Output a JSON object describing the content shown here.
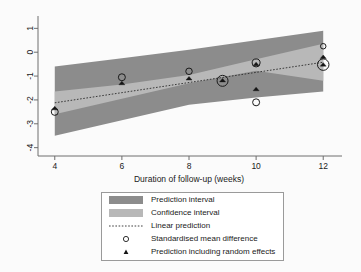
{
  "chart_data": {
    "type": "scatter",
    "title": "",
    "xlabel": "Duration of follow-up (weeks)",
    "ylabel": "",
    "xlim": [
      3.5,
      12.5
    ],
    "ylim": [
      -4.35,
      1.35
    ],
    "xticks": [
      4,
      6,
      8,
      10,
      12
    ],
    "yticks": [
      1,
      0,
      -1,
      -2,
      -3,
      -4
    ],
    "grid": false,
    "legend_position": "bottom-center",
    "series": [
      {
        "name": "Prediction interval",
        "type": "area",
        "color": "#8c8c8c",
        "x": [
          4,
          6,
          8,
          10,
          12
        ],
        "upper": [
          -0.6,
          -0.25,
          0.1,
          0.5,
          0.9
        ],
        "lower": [
          -3.5,
          -2.85,
          -2.2,
          -1.9,
          -1.65
        ]
      },
      {
        "name": "Confidence interval",
        "type": "area",
        "color": "#b8b8b8",
        "x": [
          4,
          6,
          8,
          10,
          12
        ],
        "upper": [
          -1.65,
          -1.35,
          -0.95,
          -0.3,
          0.35
        ],
        "lower": [
          -2.6,
          -1.95,
          -1.3,
          -0.78,
          -1.2
        ]
      },
      {
        "name": "Linear prediction",
        "type": "line",
        "style": "dotted",
        "color": "#2a2a2a",
        "x": [
          4,
          12
        ],
        "y": [
          -2.12,
          -0.42
        ]
      },
      {
        "name": "Standardised mean difference",
        "type": "bubble",
        "marker": "open-circle",
        "points": [
          {
            "x": 4,
            "y": -2.5,
            "size": 7.0
          },
          {
            "x": 6,
            "y": -1.05,
            "size": 7.0
          },
          {
            "x": 8,
            "y": -0.8,
            "size": 6.5
          },
          {
            "x": 9,
            "y": -1.2,
            "size": 11.0
          },
          {
            "x": 10,
            "y": -0.45,
            "size": 8.0
          },
          {
            "x": 10,
            "y": -2.1,
            "size": 7.0
          },
          {
            "x": 12,
            "y": 0.25,
            "size": 5.5
          },
          {
            "x": 12,
            "y": -0.52,
            "size": 11.5
          }
        ]
      },
      {
        "name": "Prediction including random effects",
        "type": "scatter",
        "marker": "filled-triangle",
        "points": [
          {
            "x": 4,
            "y": -2.35
          },
          {
            "x": 6,
            "y": -1.3
          },
          {
            "x": 8,
            "y": -1.1
          },
          {
            "x": 9,
            "y": -1.18
          },
          {
            "x": 10,
            "y": -0.5
          },
          {
            "x": 10,
            "y": -1.55
          },
          {
            "x": 12,
            "y": -0.2
          },
          {
            "x": 12,
            "y": -0.52
          }
        ]
      }
    ]
  },
  "axes": {
    "x_title": "Duration of follow-up (weeks)",
    "x_tick_labels": [
      "4",
      "6",
      "8",
      "10",
      "12"
    ],
    "y_tick_labels": [
      "1",
      "0",
      "-1",
      "-2",
      "-3",
      "-4"
    ]
  },
  "legend": {
    "items": [
      {
        "label": "Prediction interval",
        "key": "band-dark-swatch"
      },
      {
        "label": "Confidence interval",
        "key": "band-light-swatch"
      },
      {
        "label": "Linear prediction",
        "key": "dotted-line-swatch"
      },
      {
        "label": "Standardised mean difference",
        "key": "open-circle-marker"
      },
      {
        "label": "Prediction including random effects",
        "key": "filled-triangle-marker"
      }
    ]
  },
  "colors": {
    "prediction_band": "#8c8c8c",
    "confidence_band": "#b8b8b8",
    "line": "#2a2a2a",
    "marker": "#151515",
    "background": "#fbfbfb"
  }
}
